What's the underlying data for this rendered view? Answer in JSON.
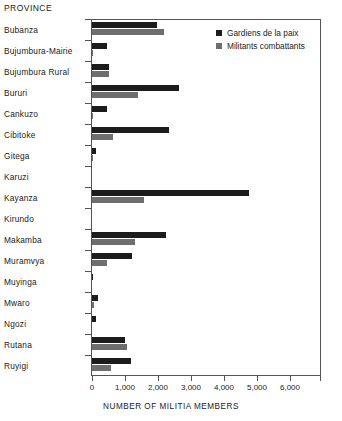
{
  "chart_data": {
    "type": "bar",
    "orientation": "horizontal",
    "title": "",
    "ylabel": "PROVINCE",
    "xlabel": "NUMBER OF MILITIA MEMBERS",
    "xlim": [
      0,
      6960
    ],
    "xticks": [
      0,
      1000,
      2000,
      3000,
      4000,
      5000,
      6000
    ],
    "xtick_labels": [
      "0",
      "1,000",
      "2,000",
      "3,000",
      "4,000",
      "5,000",
      "6,000"
    ],
    "grid": false,
    "legend_position": "top-right",
    "categories": [
      "Bubanza",
      "Bujumbura-Mairie",
      "Bujumbura Rural",
      "Bururi",
      "Cankuzo",
      "Cibitoke",
      "Gitega",
      "Karuzi",
      "Kayanza",
      "Kirundo",
      "Makamba",
      "Muramvya",
      "Muyinga",
      "Mwaro",
      "Ngozi",
      "Rutana",
      "Ruyigi"
    ],
    "series": [
      {
        "name": "Gardiens de la paix",
        "color": "#1c1c1c",
        "values": [
          1970,
          440,
          500,
          2630,
          450,
          2330,
          130,
          0,
          4760,
          0,
          2240,
          1210,
          30,
          180,
          110,
          1000,
          1180
        ]
      },
      {
        "name": "Militants combattants",
        "color": "#6e6e6e",
        "values": [
          2180,
          20,
          500,
          1390,
          40,
          640,
          20,
          0,
          1580,
          0,
          1300,
          450,
          0,
          60,
          0,
          1050,
          570
        ]
      }
    ]
  }
}
